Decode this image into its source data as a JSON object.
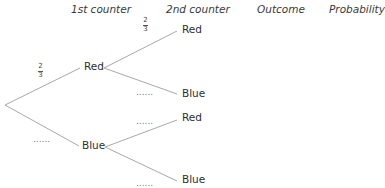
{
  "headers": {
    "first": "1st counter",
    "second": "2nd counter",
    "outcome": "Outcome",
    "probability": "Probability"
  },
  "tree": {
    "level1": [
      {
        "label": "Red",
        "prob_num": "2",
        "prob_den": "3"
      },
      {
        "label": "Blue",
        "prob_blank": "......"
      }
    ],
    "level2_after_red": [
      {
        "label": "Red",
        "prob_num": "2",
        "prob_den": "3"
      },
      {
        "label": "Blue",
        "prob_blank": "......"
      }
    ],
    "level2_after_blue": [
      {
        "label": "Red",
        "prob_blank": "......"
      },
      {
        "label": "Blue",
        "prob_blank": "......"
      }
    ]
  },
  "colors": {
    "line": "#a8a8a8",
    "text": "#2e2e2e"
  }
}
